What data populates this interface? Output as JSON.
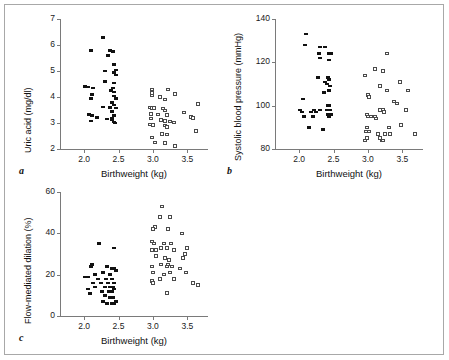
{
  "figure": {
    "panel_labels": {
      "a": "a",
      "b": "b",
      "c": "c"
    },
    "shared_xlabel": "Birthweight (kg)"
  },
  "chart_data": [
    {
      "id": "panel-a",
      "type": "scatter",
      "title": "",
      "panel_label": "a",
      "xlabel": "Birthweight (kg)",
      "ylabel": "Uric acid (mg/dl)",
      "xlim": [
        1.65,
        3.8
      ],
      "ylim": [
        2,
        7
      ],
      "xticks": [
        2.0,
        2.5,
        3.0,
        3.5
      ],
      "xticklabels": [
        "2.0",
        "2.5",
        "3.0",
        "3.5"
      ],
      "yticks": [
        2,
        3,
        4,
        5,
        6,
        7
      ],
      "yticklabels": [
        "2",
        "3",
        "4",
        "5",
        "6",
        "7"
      ],
      "grid": false,
      "legend": "none",
      "series": [
        {
          "name": "low birthweight (filled)",
          "marker": "filled-square",
          "points": [
            [
              2.27,
              6.3
            ],
            [
              2.1,
              5.8
            ],
            [
              2.37,
              5.8
            ],
            [
              2.42,
              5.75
            ],
            [
              2.35,
              5.6
            ],
            [
              2.44,
              5.25
            ],
            [
              2.46,
              5.05
            ],
            [
              2.3,
              5.0
            ],
            [
              2.44,
              4.95
            ],
            [
              2.47,
              4.85
            ],
            [
              2.3,
              4.6
            ],
            [
              2.43,
              4.55
            ],
            [
              2.02,
              4.4
            ],
            [
              2.05,
              4.38
            ],
            [
              2.13,
              4.35
            ],
            [
              2.42,
              4.35
            ],
            [
              2.39,
              4.25
            ],
            [
              2.44,
              4.2
            ],
            [
              2.12,
              4.1
            ],
            [
              2.43,
              4.05
            ],
            [
              2.1,
              3.95
            ],
            [
              2.46,
              3.95
            ],
            [
              2.41,
              3.8
            ],
            [
              2.44,
              3.7
            ],
            [
              2.28,
              3.62
            ],
            [
              2.38,
              3.6
            ],
            [
              2.47,
              3.58
            ],
            [
              2.4,
              3.45
            ],
            [
              2.07,
              3.33
            ],
            [
              2.12,
              3.3
            ],
            [
              2.44,
              3.3
            ],
            [
              2.19,
              3.22
            ],
            [
              2.41,
              3.2
            ],
            [
              2.33,
              3.15
            ],
            [
              2.4,
              3.12
            ],
            [
              2.1,
              3.08
            ],
            [
              2.44,
              3.05
            ],
            [
              2.45,
              3.0
            ]
          ]
        },
        {
          "name": "normal birthweight (open)",
          "marker": "open-square",
          "points": [
            [
              2.98,
              4.28
            ],
            [
              3.22,
              4.28
            ],
            [
              2.98,
              4.15
            ],
            [
              3.32,
              4.12
            ],
            [
              2.98,
              4.05
            ],
            [
              3.1,
              4.0
            ],
            [
              3.18,
              3.9
            ],
            [
              3.65,
              3.72
            ],
            [
              2.96,
              3.6
            ],
            [
              2.99,
              3.58
            ],
            [
              3.02,
              3.58
            ],
            [
              3.14,
              3.55
            ],
            [
              3.18,
              3.48
            ],
            [
              3.45,
              3.4
            ],
            [
              2.97,
              3.35
            ],
            [
              3.08,
              3.32
            ],
            [
              3.21,
              3.3
            ],
            [
              3.55,
              3.22
            ],
            [
              3.58,
              3.2
            ],
            [
              2.97,
              3.18
            ],
            [
              3.12,
              3.12
            ],
            [
              3.18,
              3.08
            ],
            [
              3.25,
              3.05
            ],
            [
              3.3,
              3.02
            ],
            [
              2.96,
              2.95
            ],
            [
              3.0,
              2.92
            ],
            [
              3.17,
              2.9
            ],
            [
              3.21,
              2.85
            ],
            [
              3.63,
              2.7
            ],
            [
              3.13,
              2.58
            ],
            [
              3.2,
              2.55
            ],
            [
              2.98,
              2.45
            ],
            [
              3.03,
              2.25
            ],
            [
              3.18,
              2.22
            ],
            [
              3.32,
              2.12
            ]
          ]
        }
      ]
    },
    {
      "id": "panel-b",
      "type": "scatter",
      "title": "",
      "panel_label": "b",
      "xlabel": "Birthweight (kg)",
      "ylabel": "Systolic blood pressure (mmHg)",
      "xlim": [
        1.65,
        3.8
      ],
      "ylim": [
        80,
        140
      ],
      "xticks": [
        2.0,
        2.5,
        3.0,
        3.5
      ],
      "xticklabels": [
        "2.0",
        "2.5",
        "3.0",
        "3.5"
      ],
      "yticks": [
        80,
        100,
        120,
        140
      ],
      "yticklabels": [
        "80",
        "100",
        "120",
        "140"
      ],
      "grid": false,
      "legend": "none",
      "series": [
        {
          "name": "low birthweight (filled)",
          "marker": "filled-square",
          "points": [
            [
              2.1,
              133
            ],
            [
              2.08,
              128
            ],
            [
              2.3,
              127
            ],
            [
              2.37,
              127
            ],
            [
              2.29,
              124
            ],
            [
              2.44,
              124
            ],
            [
              2.46,
              124
            ],
            [
              2.3,
              122
            ],
            [
              2.44,
              121
            ],
            [
              2.28,
              113
            ],
            [
              2.42,
              113
            ],
            [
              2.44,
              112
            ],
            [
              2.38,
              111
            ],
            [
              2.41,
              110
            ],
            [
              2.45,
              109
            ],
            [
              2.43,
              107
            ],
            [
              2.36,
              106
            ],
            [
              2.05,
              103
            ],
            [
              2.42,
              100
            ],
            [
              2.44,
              100
            ],
            [
              2.02,
              98
            ],
            [
              2.22,
              98
            ],
            [
              2.3,
              98
            ],
            [
              2.4,
              98
            ],
            [
              2.45,
              98
            ],
            [
              2.04,
              97
            ],
            [
              2.18,
              97
            ],
            [
              2.25,
              97
            ],
            [
              2.47,
              96
            ],
            [
              2.42,
              96
            ],
            [
              2.07,
              95
            ],
            [
              2.2,
              95
            ],
            [
              2.44,
              95
            ],
            [
              2.14,
              90
            ],
            [
              2.35,
              89
            ]
          ]
        },
        {
          "name": "normal birthweight (open)",
          "marker": "open-square",
          "points": [
            [
              3.27,
              124
            ],
            [
              3.1,
              117
            ],
            [
              3.22,
              116
            ],
            [
              2.96,
              114
            ],
            [
              3.47,
              111
            ],
            [
              3.18,
              109
            ],
            [
              3.28,
              107
            ],
            [
              3.58,
              107
            ],
            [
              3.0,
              105
            ],
            [
              3.02,
              104
            ],
            [
              3.38,
              102
            ],
            [
              3.42,
              101
            ],
            [
              3.55,
              98
            ],
            [
              2.98,
              96
            ],
            [
              3.0,
              95
            ],
            [
              3.04,
              95
            ],
            [
              3.1,
              95
            ],
            [
              3.18,
              98
            ],
            [
              3.22,
              98
            ],
            [
              3.24,
              97
            ],
            [
              3.12,
              94
            ],
            [
              2.98,
              90
            ],
            [
              3.3,
              90
            ],
            [
              3.48,
              91
            ],
            [
              2.97,
              88
            ],
            [
              3.02,
              88
            ],
            [
              3.14,
              87
            ],
            [
              3.25,
              87
            ],
            [
              3.32,
              87
            ],
            [
              3.68,
              87
            ],
            [
              2.98,
              85
            ],
            [
              3.18,
              85
            ],
            [
              3.2,
              84
            ],
            [
              3.22,
              84
            ],
            [
              2.96,
              84
            ]
          ]
        }
      ]
    },
    {
      "id": "panel-c",
      "type": "scatter",
      "title": "",
      "panel_label": "c",
      "xlabel": "Birthweight (kg)",
      "ylabel": "Flow-mediated dilation (%)",
      "xlim": [
        1.65,
        3.8
      ],
      "ylim": [
        0,
        60
      ],
      "xticks": [
        2.0,
        2.5,
        3.0,
        3.5
      ],
      "xticklabels": [
        "2.0",
        "2.5",
        "3.0",
        "3.5"
      ],
      "yticks": [
        0,
        20,
        40,
        60
      ],
      "yticklabels": [
        "0",
        "20",
        "40",
        "60"
      ],
      "grid": false,
      "legend": "none",
      "series": [
        {
          "name": "low birthweight (filled)",
          "marker": "filled-square",
          "points": [
            [
              2.22,
              35
            ],
            [
              2.44,
              33
            ],
            [
              2.12,
              25
            ],
            [
              2.34,
              24
            ],
            [
              2.4,
              23
            ],
            [
              2.1,
              24
            ],
            [
              2.43,
              23
            ],
            [
              2.46,
              22
            ],
            [
              2.16,
              20
            ],
            [
              2.28,
              21
            ],
            [
              2.38,
              20
            ],
            [
              2.02,
              19
            ],
            [
              2.06,
              19
            ],
            [
              2.2,
              18
            ],
            [
              2.32,
              18
            ],
            [
              2.41,
              18
            ],
            [
              2.13,
              16
            ],
            [
              2.25,
              16
            ],
            [
              2.35,
              16
            ],
            [
              2.44,
              16
            ],
            [
              2.16,
              14
            ],
            [
              2.3,
              14
            ],
            [
              2.38,
              14
            ],
            [
              2.42,
              14
            ],
            [
              2.05,
              13
            ],
            [
              2.26,
              12
            ],
            [
              2.36,
              12
            ],
            [
              2.4,
              12
            ],
            [
              2.44,
              13
            ],
            [
              2.08,
              11
            ],
            [
              2.31,
              10
            ],
            [
              2.37,
              9
            ],
            [
              2.42,
              9
            ],
            [
              2.28,
              7
            ],
            [
              2.34,
              6
            ],
            [
              2.4,
              6
            ],
            [
              2.44,
              6
            ],
            [
              2.46,
              7
            ]
          ]
        },
        {
          "name": "normal birthweight (open)",
          "marker": "open-square",
          "points": [
            [
              3.13,
              53
            ],
            [
              3.1,
              48
            ],
            [
              3.25,
              48
            ],
            [
              3.03,
              43
            ],
            [
              3.0,
              42
            ],
            [
              3.22,
              42
            ],
            [
              3.42,
              40
            ],
            [
              2.99,
              36
            ],
            [
              3.02,
              35
            ],
            [
              3.16,
              35
            ],
            [
              3.26,
              35
            ],
            [
              3.5,
              33
            ],
            [
              2.98,
              32
            ],
            [
              3.05,
              32
            ],
            [
              3.12,
              33
            ],
            [
              3.2,
              33
            ],
            [
              3.3,
              32
            ],
            [
              3.46,
              30
            ],
            [
              3.04,
              29
            ],
            [
              3.18,
              28
            ],
            [
              3.24,
              27
            ],
            [
              3.44,
              28
            ],
            [
              2.98,
              24
            ],
            [
              3.12,
              25
            ],
            [
              3.2,
              24
            ],
            [
              3.22,
              25
            ],
            [
              3.28,
              24
            ],
            [
              3.4,
              23
            ],
            [
              3.0,
              21
            ],
            [
              3.16,
              20
            ],
            [
              3.25,
              21
            ],
            [
              3.48,
              21
            ],
            [
              2.99,
              17
            ],
            [
              3.1,
              18
            ],
            [
              3.3,
              18
            ],
            [
              3.58,
              16
            ],
            [
              3.66,
              15
            ],
            [
              3.2,
              11
            ],
            [
              3.0,
              16
            ]
          ]
        }
      ]
    }
  ]
}
